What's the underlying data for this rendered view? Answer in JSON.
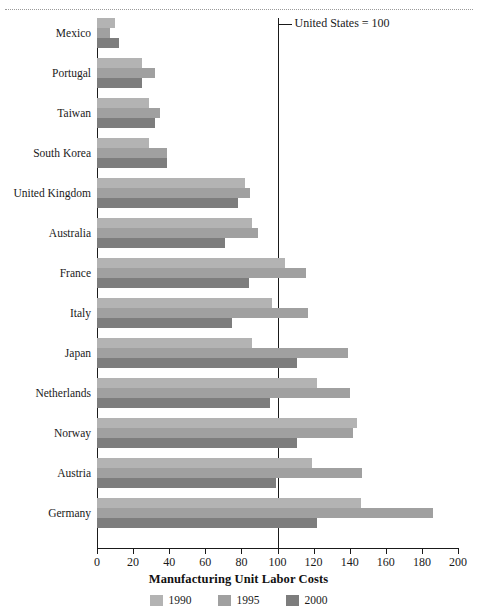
{
  "chart_data": {
    "type": "bar",
    "orientation": "horizontal",
    "title": "",
    "xlabel": "Manufacturing Unit Labor Costs",
    "ylabel": "",
    "xlim": [
      0,
      200
    ],
    "xticks": [
      0,
      20,
      40,
      60,
      80,
      100,
      120,
      140,
      160,
      180,
      200
    ],
    "grid": false,
    "legend_position": "bottom",
    "reference_line": {
      "value": 100,
      "label": "United States = 100"
    },
    "categories": [
      "Mexico",
      "Portugal",
      "Taiwan",
      "South Korea",
      "United Kingdom",
      "Australia",
      "France",
      "Italy",
      "Japan",
      "Netherlands",
      "Norway",
      "Austria",
      "Germany"
    ],
    "series": [
      {
        "name": "1990",
        "color": "#b3b3b3",
        "values": [
          10,
          25,
          29,
          29,
          82,
          86,
          104,
          97,
          86,
          122,
          144,
          119,
          146
        ]
      },
      {
        "name": "1995",
        "color": "#a0a0a0",
        "values": [
          7,
          32,
          35,
          39,
          85,
          89,
          116,
          117,
          139,
          140,
          142,
          147,
          186
        ]
      },
      {
        "name": "2000",
        "color": "#7d7d7d",
        "values": [
          12,
          25,
          32,
          39,
          78,
          71,
          84,
          75,
          111,
          96,
          111,
          99,
          122
        ]
      }
    ]
  },
  "legend": {
    "items": [
      {
        "label": "1990",
        "color": "#b3b3b3"
      },
      {
        "label": "1995",
        "color": "#a0a0a0"
      },
      {
        "label": "2000",
        "color": "#7d7d7d"
      }
    ]
  },
  "annotation": {
    "reference_text": "United States = 100"
  },
  "axis": {
    "x_title": "Manufacturing Unit Labor Costs"
  }
}
